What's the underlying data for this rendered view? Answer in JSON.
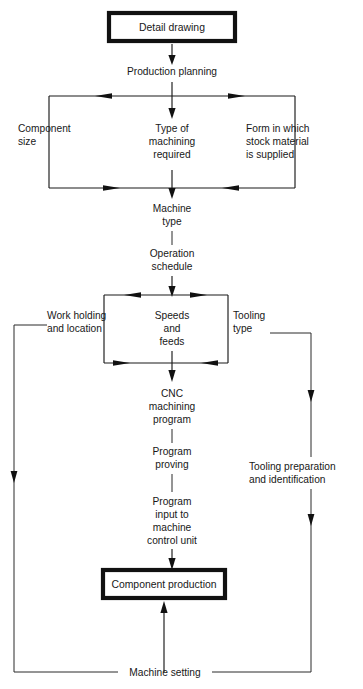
{
  "diagram": {
    "type": "flowchart",
    "stroke_color": "#111111",
    "background_color": "#ffffff",
    "nodes": {
      "detail_drawing": "Detail drawing",
      "production_planning": "Production planning",
      "component_size_1": "Component",
      "component_size_2": "size",
      "type_machining_1": "Type of",
      "type_machining_2": "machining",
      "type_machining_3": "required",
      "form_stock_1": "Form in which",
      "form_stock_2": "stock material",
      "form_stock_3": "is supplied",
      "machine_type_1": "Machine",
      "machine_type_2": "type",
      "operation_schedule_1": "Operation",
      "operation_schedule_2": "schedule",
      "work_holding_1": "Work holding",
      "work_holding_2": "and location",
      "speeds_feeds_1": "Speeds",
      "speeds_feeds_2": "and",
      "speeds_feeds_3": "feeds",
      "tooling_type_1": "Tooling",
      "tooling_type_2": "type",
      "cnc_program_1": "CNC",
      "cnc_program_2": "machining",
      "cnc_program_3": "program",
      "program_proving_1": "Program",
      "program_proving_2": "proving",
      "program_input_1": "Program",
      "program_input_2": "input to",
      "program_input_3": "machine",
      "program_input_4": "control unit",
      "tooling_prep_1": "Tooling preparation",
      "tooling_prep_2": "and identification",
      "component_production": "Component production",
      "machine_setting": "Machine setting"
    }
  }
}
